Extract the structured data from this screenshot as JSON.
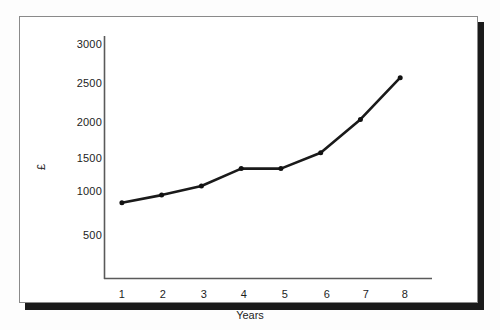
{
  "figure": {
    "frame_border_color": "#8a8a8a",
    "shadow_color": "#1a1a1a",
    "background": "#ffffff"
  },
  "chart_data": {
    "type": "line",
    "title": "",
    "subtitle": "",
    "xlabel": "Years",
    "ylabel": "£",
    "x": [
      1,
      2,
      3,
      4,
      5,
      6,
      7,
      8
    ],
    "categories": [
      "1",
      "2",
      "3",
      "4",
      "5",
      "6",
      "7",
      "8"
    ],
    "values": [
      1000,
      1100,
      1220,
      1450,
      1450,
      1660,
      2100,
      2650
    ],
    "series": [
      {
        "name": "",
        "values": [
          1000,
          1100,
          1220,
          1450,
          1450,
          1660,
          2100,
          2650
        ]
      }
    ],
    "xlim": [
      0.55,
      8.8
    ],
    "ylim": [
      0,
      3200
    ],
    "y_ticks": [
      500,
      1000,
      1500,
      2000,
      2500,
      3000
    ],
    "y_tick_labels": [
      "500",
      "1000",
      "1500",
      "2000",
      "2500",
      "3000"
    ],
    "x_ticks": [
      1,
      2,
      3,
      4,
      5,
      6,
      7,
      8
    ],
    "x_tick_labels": [
      "1",
      "2",
      "3",
      "4",
      "5",
      "6",
      "7",
      "8"
    ],
    "grid": false,
    "legend": null,
    "legend_position": "none",
    "line_color": "#1a1a1a",
    "line_width": 2.6,
    "marker": "circle",
    "marker_color": "#111111",
    "marker_size": 4,
    "annotations": []
  },
  "axis": {
    "line_color": "#5a5a5a",
    "y_label_rotated": true
  }
}
